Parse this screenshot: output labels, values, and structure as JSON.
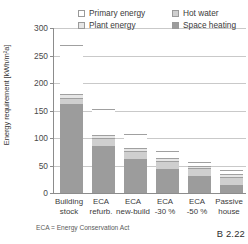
{
  "chart_data": {
    "type": "bar",
    "subtype": "stacked-bar",
    "title": "",
    "xlabel": "",
    "ylabel": "Energy requirement [kWh/m²a]",
    "ylim": [
      0,
      300
    ],
    "yticks": [
      0,
      50,
      100,
      150,
      200,
      250,
      300
    ],
    "grid": true,
    "legend_position": "top-inside",
    "categories": [
      "Building stock",
      "ECA refurb.",
      "ECA new-build",
      "ECA -30 %",
      "ECA -50 %",
      "Passive house"
    ],
    "series": [
      {
        "name": "Space heating",
        "values": [
          162,
          85,
          62,
          44,
          31,
          15
        ]
      },
      {
        "name": "Hot water",
        "values": [
          10,
          15,
          14,
          14,
          14,
          14
        ]
      },
      {
        "name": "Plant energy",
        "values": [
          8,
          5,
          5,
          5,
          5,
          5
        ]
      },
      {
        "name": "Primary energy",
        "values": [
          90,
          48,
          27,
          14,
          6,
          8
        ]
      }
    ],
    "totals": [
      270,
      153,
      108,
      77,
      56,
      42
    ],
    "stack_order_bottom_to_top": [
      "Space heating",
      "Hot water",
      "Plant energy",
      "Primary energy"
    ]
  },
  "axis": {
    "y_title": "Energy requirement [kWh/m²a]",
    "y_tick_labels": [
      "0",
      "50",
      "100",
      "150",
      "200",
      "250",
      "300"
    ]
  },
  "legend": {
    "items": [
      {
        "label": "Primary energy",
        "swatch": "primary",
        "color": "#ffffff"
      },
      {
        "label": "Plant energy",
        "swatch": "plant",
        "color": "#e6e6e6"
      },
      {
        "label": "Hot water",
        "swatch": "hotwater",
        "color": "#cfcfcf"
      },
      {
        "label": "Space heating",
        "swatch": "heating",
        "color": "#9c9c9c"
      }
    ]
  },
  "xaxis": {
    "labels": [
      "Building\nstock",
      "ECA\nrefurb.",
      "ECA\nnew-build",
      "ECA\n-30 %",
      "ECA\n-50 %",
      "Passive\nhouse"
    ]
  },
  "footnote": "ECA = Energy Conservation Act",
  "figure_number": "B 2.22"
}
